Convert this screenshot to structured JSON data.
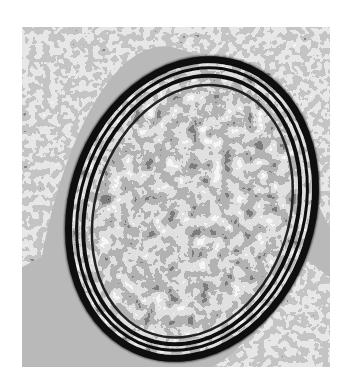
{
  "image": {
    "kind": "electron-micrograph",
    "description": "Grayscale transmission electron micrograph of an oval membrane-bound body with concentric dark lamellae and a mottled granular interior, surrounded by granular cytoplasm",
    "colors": {
      "page_background": "#ffffff",
      "field_background": "#b9b9b9",
      "membrane": "#111111",
      "interior_light": "#e6e6e6",
      "interior_dark": "#1a1a1a"
    }
  }
}
